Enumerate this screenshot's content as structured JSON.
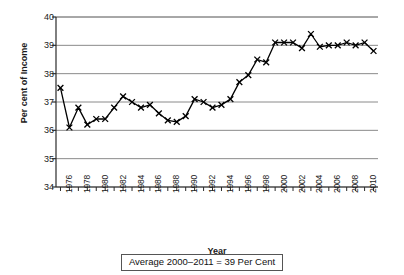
{
  "chart_data": {
    "type": "line",
    "title": "",
    "xlabel": "Year",
    "ylabel": "Per cent of Income",
    "xlim": [
      1975.5,
      2011.5
    ],
    "ylim": [
      34,
      40
    ],
    "grid": true,
    "legend": false,
    "marker": "x",
    "line_color": "#000000",
    "annotation": "Average 2000–2011 = 39 Per Cent",
    "ytick_labels": [
      "34",
      "35",
      "36",
      "37",
      "38",
      "39",
      "40"
    ],
    "ytick_values": [
      34,
      35,
      36,
      37,
      38,
      39,
      40
    ],
    "xtick_labels": [
      "1976",
      "1978",
      "1980",
      "1982",
      "1984",
      "1986",
      "1988",
      "1990",
      "1992",
      "1994",
      "1996",
      "1998",
      "2000",
      "2002",
      "2004",
      "2006",
      "2008",
      "2010"
    ],
    "xtick_values": [
      1976,
      1978,
      1980,
      1982,
      1984,
      1986,
      1988,
      1990,
      1992,
      1994,
      1996,
      1998,
      2000,
      2002,
      2004,
      2006,
      2008,
      2010
    ],
    "x": [
      1976,
      1977,
      1978,
      1979,
      1980,
      1981,
      1982,
      1983,
      1984,
      1985,
      1986,
      1987,
      1988,
      1989,
      1990,
      1991,
      1992,
      1993,
      1994,
      1995,
      1996,
      1997,
      1998,
      1999,
      2000,
      2001,
      2002,
      2003,
      2004,
      2005,
      2006,
      2007,
      2008,
      2009,
      2010,
      2011
    ],
    "values": [
      37.5,
      36.1,
      36.8,
      36.2,
      36.4,
      36.4,
      36.8,
      37.2,
      37.0,
      36.8,
      36.9,
      36.6,
      36.35,
      36.3,
      36.5,
      37.1,
      37.0,
      36.8,
      36.9,
      37.1,
      37.7,
      37.95,
      38.5,
      38.4,
      39.1,
      39.1,
      39.1,
      38.9,
      39.4,
      38.95,
      39.0,
      39.0,
      39.1,
      39.0,
      39.1,
      38.8
    ]
  },
  "axis": {
    "y_title": "Per cent of Income",
    "x_title": "Year"
  },
  "caption": {
    "text": "Average 2000–2011 = 39 Per Cent"
  }
}
